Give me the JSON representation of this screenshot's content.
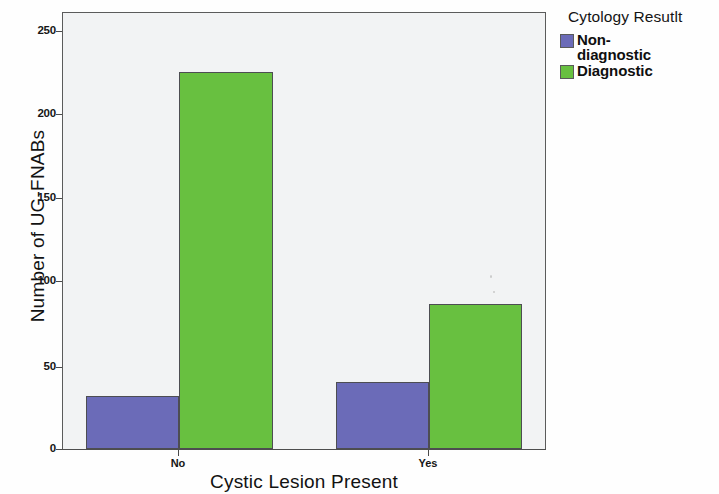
{
  "chart_data": {
    "type": "bar",
    "title": "",
    "xlabel": "Cystic Lesion Present",
    "ylabel": "Number of UG-FNABs",
    "categories": [
      "No",
      "Yes"
    ],
    "series": [
      {
        "name": "Non-diagnostic",
        "values": [
          32,
          40
        ],
        "color": "#6B6BB8"
      },
      {
        "name": "Diagnostic",
        "values": [
          226,
          87
        ],
        "color": "#68C040"
      }
    ],
    "ylim": [
      0,
      262
    ],
    "yticks": [
      0,
      50,
      100,
      150,
      200,
      250
    ],
    "ytick_labels": [
      "0",
      "50",
      "100",
      "150",
      "200",
      "250"
    ],
    "grid": false,
    "legend_position": "right",
    "legend_title": "Cytology Resutlt"
  },
  "axes": {
    "y_title": "Number of UG-FNABs",
    "x_title": "Cystic Lesion Present",
    "y_ticks": [
      {
        "label": "250",
        "value": 250
      },
      {
        "label": "200",
        "value": 200
      },
      {
        "label": "150",
        "value": 150
      },
      {
        "label": "100",
        "value": 100
      },
      {
        "label": "50",
        "value": 50
      },
      {
        "label": "0",
        "value": 0
      }
    ],
    "x_ticks": [
      {
        "label": "No"
      },
      {
        "label": "Yes"
      }
    ]
  },
  "legend": {
    "title": "Cytology Resutlt",
    "items": [
      {
        "label": "Non-diagnostic",
        "label_line1": "Non-",
        "label_line2": "diagnostic",
        "color": "#6B6BB8"
      },
      {
        "label": "Diagnostic",
        "label_line1": "Diagnostic",
        "label_line2": "",
        "color": "#68C040"
      }
    ]
  },
  "style": {
    "panel_background": "#f2f3f4",
    "frame_color": "#5b5b5b",
    "page_background": "#fefefe",
    "bar_border": "#4d4d52"
  }
}
